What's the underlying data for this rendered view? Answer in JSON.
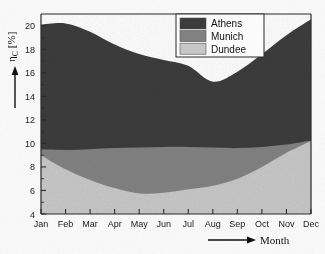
{
  "figure": {
    "background_color": "#fbfbfb",
    "plot_background_color": "#ffffff",
    "axis_color": "#2b2b2b"
  },
  "axes": {
    "y_title": "η",
    "y_title_sub": "C",
    "y_title_unit": "[%]",
    "x_title": "Month",
    "y_ticks": [
      "4",
      "6",
      "8",
      "10",
      "12",
      "14",
      "16",
      "18",
      "20"
    ],
    "x_ticks": [
      "Jan",
      "Feb",
      "Mar",
      "Apr",
      "May",
      "Jun",
      "Jul",
      "Aug",
      "Sep",
      "Oct",
      "Nov",
      "Dec"
    ]
  },
  "legend": {
    "position": "top-right-inside",
    "items": [
      {
        "label": "Athens",
        "color": "#3c3c3c"
      },
      {
        "label": "Munich",
        "color": "#838383"
      },
      {
        "label": "Dundee",
        "color": "#c9c9c9"
      }
    ]
  },
  "chart_data": {
    "type": "area",
    "stacked": true,
    "title": "",
    "xlabel": "Month",
    "ylabel": "η_C [%]",
    "ylim": [
      4,
      21
    ],
    "xlim": [
      "Jan",
      "Dec"
    ],
    "grid": false,
    "legend_position": "top right (inside axes)",
    "categories": [
      "Jan",
      "Feb",
      "Mar",
      "Apr",
      "May",
      "Jun",
      "Jul",
      "Aug",
      "Sep",
      "Oct",
      "Nov",
      "Dec"
    ],
    "note": "Cumulative (stacked) boundary values read off the y-axis; each series' own contribution is the difference between successive boundaries.",
    "cumulative_boundaries": {
      "Dundee_top": [
        9.0,
        7.8,
        6.9,
        6.2,
        5.75,
        5.8,
        6.1,
        6.4,
        7.0,
        8.0,
        9.2,
        10.2
      ],
      "Munich_top": [
        9.5,
        9.45,
        9.5,
        9.6,
        9.65,
        9.7,
        9.7,
        9.65,
        9.6,
        9.7,
        9.9,
        10.25
      ],
      "Athens_top": [
        20.1,
        20.2,
        19.5,
        18.4,
        17.6,
        17.1,
        16.6,
        15.25,
        16.1,
        17.6,
        19.2,
        20.55
      ]
    },
    "series": [
      {
        "name": "Dundee",
        "color": "#c9c9c9",
        "values": [
          9.0,
          7.8,
          6.9,
          6.2,
          5.75,
          5.8,
          6.1,
          6.4,
          7.0,
          8.0,
          9.2,
          10.2
        ]
      },
      {
        "name": "Munich",
        "color": "#838383",
        "values": [
          0.5,
          1.65,
          2.6,
          3.4,
          3.9,
          3.9,
          3.6,
          3.25,
          2.6,
          1.7,
          0.7,
          0.05
        ]
      },
      {
        "name": "Athens",
        "color": "#3c3c3c",
        "values": [
          10.6,
          10.75,
          10.0,
          8.8,
          7.95,
          7.4,
          6.9,
          5.6,
          6.5,
          7.9,
          9.3,
          10.3
        ]
      }
    ]
  }
}
